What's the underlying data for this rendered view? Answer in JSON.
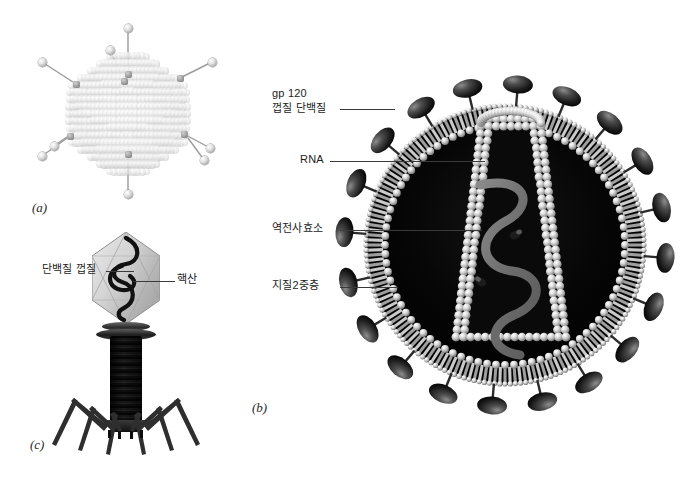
{
  "figure": {
    "background_color": "#ffffff"
  },
  "panels": [
    {
      "id": "panel-a",
      "tag": "(a)",
      "subject": "adenovirus",
      "tag_x": 32,
      "tag_y": 204
    },
    {
      "id": "panel-b",
      "tag": "(b)",
      "subject": "hiv-virion",
      "tag_x": 252,
      "tag_y": 404
    },
    {
      "id": "panel-c",
      "tag": "(c)",
      "subject": "bacteriophage",
      "tag_x": 30,
      "tag_y": 441
    }
  ],
  "labels": {
    "gp120_line1": "gp 120",
    "gp120_line2": "껍질 단백질",
    "rna": "RNA",
    "reverse_transcriptase": "역전사효소",
    "lipid_bilayer": "지질2중층",
    "protein_coat": "단백질 껍질",
    "nucleic_acid": "핵산"
  },
  "colors": {
    "text": "#1c1c1c",
    "leader_line": "#3a3a3a",
    "capsid_light": "#d2d2d2",
    "capsid_highlight": "#ffffff",
    "spike_dark": "#0b0b0b",
    "core_interior": "#000000",
    "phage_tail": "#1a1a1a",
    "rna_strand": "#6f6f6f"
  },
  "structures": {
    "adenovirus": {
      "name": "adenovirus",
      "capsid_shape": "icosahedral",
      "fiber_count": 8,
      "has_knobs": true
    },
    "hiv": {
      "name": "hiv-virion",
      "envelope": "lipid bilayer",
      "spike_count": 20,
      "core_shape": "truncated cone",
      "genome": "RNA",
      "enzyme_count": 2
    },
    "bacteriophage": {
      "name": "t4-bacteriophage",
      "head_shape": "icosahedral",
      "tail_fiber_count": 6,
      "genome": "nucleic acid"
    }
  }
}
